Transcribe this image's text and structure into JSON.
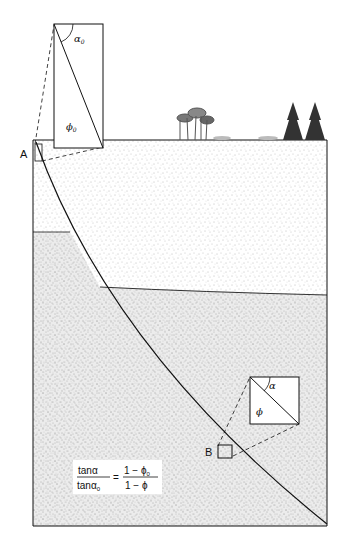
{
  "diagram": {
    "points": {
      "A": "A",
      "B": "B"
    },
    "inset_top": {
      "angle_label": "α",
      "angle_sub": "0",
      "porosity_label": "ϕ",
      "porosity_sub": "0"
    },
    "inset_bottom": {
      "angle_label": "α",
      "porosity_label": "ϕ"
    },
    "equation": {
      "num_left": "tanα",
      "den_left": "tanα",
      "den_left_sub": "0",
      "equals": "=",
      "num_right": "1 − ϕ",
      "num_right_sub": "0",
      "den_right": "1 − ϕ"
    },
    "colors": {
      "upper_layer": "#ffffff",
      "lower_layer": "#ececec",
      "line": "#111111",
      "stipple": "#777777"
    }
  }
}
